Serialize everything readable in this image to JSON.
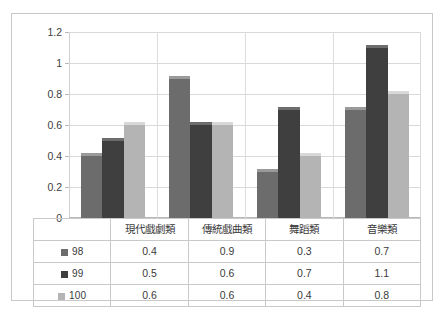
{
  "chart_data": {
    "type": "bar",
    "title": "",
    "subtitle": "",
    "xlabel": "",
    "ylabel": "",
    "categories": [
      "現代戲劇類",
      "傳統戲曲類",
      "舞蹈類",
      "音樂類"
    ],
    "series": [
      {
        "name": "98",
        "color": "#6c6c6c",
        "values": [
          0.4,
          0.9,
          0.3,
          0.7
        ]
      },
      {
        "name": "99",
        "color": "#3f3f3f",
        "values": [
          0.5,
          0.6,
          0.7,
          1.1
        ]
      },
      {
        "name": "100",
        "color": "#b4b4b4",
        "values": [
          0.6,
          0.6,
          0.4,
          0.8
        ]
      }
    ],
    "ylim": [
      0,
      1.2
    ],
    "ytick_labels": [
      "1.2",
      "1",
      "0.8",
      "0.6",
      "0.4",
      "0.2",
      "0"
    ],
    "ytick_values": [
      1.2,
      1.0,
      0.8,
      0.6,
      0.4,
      0.2,
      0
    ],
    "grid": true,
    "legend_position": "data-table-left",
    "has_data_table": true
  },
  "data_table": {
    "column_headers": [
      "現代戲劇類",
      "傳統戲曲類",
      "舞蹈類",
      "音樂類"
    ],
    "rows": [
      {
        "label": "98",
        "cells": [
          "0.4",
          "0.9",
          "0.3",
          "0.7"
        ]
      },
      {
        "label": "99",
        "cells": [
          "0.5",
          "0.6",
          "0.7",
          "1.1"
        ]
      },
      {
        "label": "100",
        "cells": [
          "0.6",
          "0.6",
          "0.4",
          "0.8"
        ]
      }
    ]
  },
  "style": {
    "bar_colors": [
      "#6c6c6c",
      "#3f3f3f",
      "#b4b4b4"
    ],
    "bar_top_colors": [
      "#9a9a9a",
      "#6d6d6d",
      "#d8d8d8"
    ],
    "frame_border": "#c8c8c8",
    "gridline_color": "#d9d9d9",
    "table_border": "#c9c9c9",
    "text_color": "#3a3a3a",
    "background": "#ffffff"
  }
}
